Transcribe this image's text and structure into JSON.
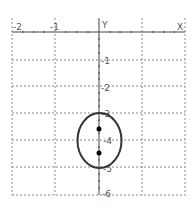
{
  "graph": {
    "axis_labels": {
      "x": "X",
      "y": "Y"
    },
    "x_ticks": [
      {
        "value": -2,
        "label": "-2"
      },
      {
        "value": -1,
        "label": "-1"
      }
    ],
    "y_ticks": [
      {
        "value": -1,
        "label": "-1"
      },
      {
        "value": -2,
        "label": "-2"
      },
      {
        "value": -3,
        "label": "-3"
      },
      {
        "value": -4,
        "label": "-4"
      },
      {
        "value": -5,
        "label": "-5"
      },
      {
        "value": -6,
        "label": "-6"
      }
    ],
    "x_range": [
      -2,
      2
    ],
    "y_range": [
      -6,
      0
    ],
    "ellipse": {
      "center": [
        0,
        -4
      ],
      "semi_x": 0.52,
      "semi_y": 1
    },
    "foci": [
      [
        0,
        -3.4
      ],
      [
        0,
        -4.55
      ]
    ],
    "colors": {
      "curve": "#333333",
      "grid": "#888888",
      "axis": "#444444",
      "point": "#000000"
    }
  }
}
